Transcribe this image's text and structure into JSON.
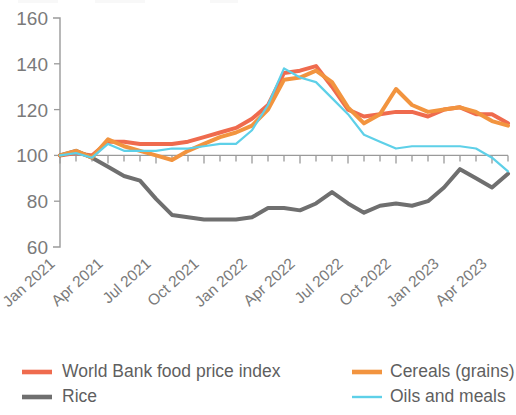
{
  "chart_data": {
    "type": "line",
    "title": "",
    "xlabel": "",
    "ylabel": "",
    "ylim": [
      60,
      160
    ],
    "yticks": [
      60,
      80,
      100,
      120,
      140,
      160
    ],
    "grid": false,
    "legend_position": "bottom",
    "x": [
      "Jan 2021",
      "Feb 2021",
      "Mar 2021",
      "Apr 2021",
      "May 2021",
      "Jun 2021",
      "Jul 2021",
      "Aug 2021",
      "Sep 2021",
      "Oct 2021",
      "Nov 2021",
      "Dec 2021",
      "Jan 2022",
      "Feb 2022",
      "Mar 2022",
      "Apr 2022",
      "May 2022",
      "Jun 2022",
      "Jul 2022",
      "Aug 2022",
      "Sep 2022",
      "Oct 2022",
      "Nov 2022",
      "Dec 2022",
      "Jan 2023",
      "Feb 2023",
      "Mar 2023",
      "Apr 2023",
      "May 2023"
    ],
    "xtick_labels": [
      "Jan 2021",
      "Apr 2021",
      "Jul 2021",
      "Oct 2021",
      "Jan 2022",
      "Apr 2022",
      "Jul 2022",
      "Oct 2022",
      "Jan 2023",
      "Apr 2023"
    ],
    "xtick_indices": [
      0,
      3,
      6,
      9,
      12,
      15,
      18,
      21,
      24,
      27
    ],
    "baseline_value": 100,
    "series": [
      {
        "name": "World Bank food price index",
        "color": "#ef6b4e",
        "values": [
          100,
          101,
          100,
          106,
          106,
          105,
          105,
          105,
          106,
          108,
          110,
          112,
          116,
          122,
          136,
          137,
          139,
          130,
          120,
          117,
          118,
          119,
          119,
          117,
          120,
          121,
          118,
          118,
          114
        ]
      },
      {
        "name": "Rice",
        "color": "#6f6f6f",
        "values": [
          100,
          102,
          99,
          95,
          91,
          89,
          81,
          74,
          73,
          72,
          72,
          72,
          73,
          77,
          77,
          76,
          79,
          84,
          79,
          75,
          78,
          79,
          78,
          80,
          86,
          94,
          90,
          86,
          92
        ]
      },
      {
        "name": "Cereals (grains)",
        "color": "#f2943f",
        "values": [
          100,
          102,
          99,
          107,
          104,
          102,
          100,
          98,
          102,
          105,
          108,
          110,
          113,
          120,
          133,
          134,
          137,
          132,
          121,
          114,
          118,
          129,
          122,
          119,
          120,
          121,
          119,
          115,
          113
        ]
      },
      {
        "name": "Oils and meals",
        "color": "#5ed0e8",
        "values": [
          100,
          101,
          99,
          105,
          102,
          102,
          102,
          103,
          103,
          104,
          105,
          105,
          111,
          122,
          138,
          134,
          132,
          125,
          118,
          109,
          106,
          103,
          104,
          104,
          104,
          104,
          103,
          99,
          93
        ]
      }
    ]
  },
  "legend": {
    "entries": [
      {
        "label": "World Bank food price index",
        "color": "#ef6b4e",
        "weight": "thick"
      },
      {
        "label": "Rice",
        "color": "#6f6f6f",
        "weight": "thick"
      },
      {
        "label": "Cereals (grains)",
        "color": "#f2943f",
        "weight": "thick"
      },
      {
        "label": "Oils and meals",
        "color": "#5ed0e8",
        "weight": "thin"
      }
    ]
  },
  "axis": {
    "y_tick_labels": [
      "160",
      "140",
      "120",
      "100",
      "80",
      "60"
    ]
  }
}
